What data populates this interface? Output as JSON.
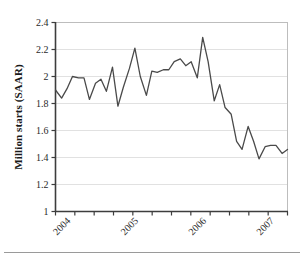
{
  "figure": {
    "background_color": "#ffffff",
    "line_color": "#4a4a4a",
    "grid_color": "#d9d9d9",
    "axis_color": "#3d3d3d"
  },
  "chart_data": {
    "type": "line",
    "title": "",
    "xlabel": "",
    "ylabel": "Million starts (SAAR)",
    "ylim": [
      1,
      2.4
    ],
    "xlim": [
      2003.83,
      2007.25
    ],
    "ytick_labels": [
      "1",
      "1.2",
      "1.4",
      "1.6",
      "1.8",
      "2",
      "2.2",
      "2.4"
    ],
    "ytick_values": [
      1,
      1.2,
      1.4,
      1.6,
      1.8,
      2,
      2.2,
      2.4
    ],
    "xtick_labels": [
      "2004",
      "2005",
      "2006",
      "2007"
    ],
    "xtick_values": [
      2004,
      2005,
      2006,
      2007
    ],
    "xtick_minor_count": 13,
    "grid": true,
    "grid_axis": "y",
    "legend": false,
    "series": [
      {
        "name": "Housing starts",
        "x": [
          2003.83,
          2003.92,
          2004.0,
          2004.08,
          2004.17,
          2004.25,
          2004.33,
          2004.42,
          2004.5,
          2004.58,
          2004.67,
          2004.75,
          2004.83,
          2004.92,
          2005.0,
          2005.08,
          2005.17,
          2005.25,
          2005.33,
          2005.42,
          2005.5,
          2005.58,
          2005.67,
          2005.75,
          2005.83,
          2005.92,
          2006.0,
          2006.08,
          2006.17,
          2006.25,
          2006.33,
          2006.42,
          2006.5,
          2006.58,
          2006.67,
          2006.75,
          2006.83,
          2006.92,
          2007.0,
          2007.08,
          2007.17,
          2007.25
        ],
        "y": [
          1.9,
          1.84,
          1.91,
          2.0,
          1.99,
          1.99,
          1.83,
          1.95,
          1.98,
          1.89,
          2.07,
          1.78,
          1.92,
          2.06,
          2.21,
          2.0,
          1.86,
          2.04,
          2.03,
          2.05,
          2.05,
          2.11,
          2.13,
          2.08,
          2.11,
          1.99,
          2.29,
          2.11,
          1.82,
          1.94,
          1.77,
          1.72,
          1.52,
          1.46,
          1.63,
          1.52,
          1.39,
          1.48,
          1.49,
          1.49,
          1.43,
          1.46
        ]
      }
    ]
  }
}
